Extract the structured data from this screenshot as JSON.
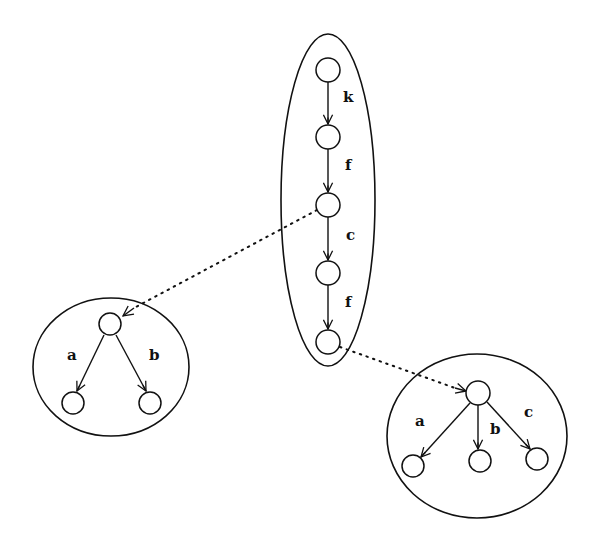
{
  "diagram": {
    "type": "tree-of-clusters",
    "chain": {
      "nodes": [
        {
          "id": "n1",
          "x": 328,
          "y": 70
        },
        {
          "id": "n2",
          "x": 328,
          "y": 137
        },
        {
          "id": "n3",
          "x": 328,
          "y": 205
        },
        {
          "id": "n4",
          "x": 328,
          "y": 273
        },
        {
          "id": "n5",
          "x": 328,
          "y": 342
        }
      ],
      "edges": [
        {
          "from": "n1",
          "to": "n2",
          "label": "k"
        },
        {
          "from": "n2",
          "to": "n3",
          "label": "f"
        },
        {
          "from": "n3",
          "to": "n4",
          "label": "c"
        },
        {
          "from": "n4",
          "to": "n5",
          "label": "f"
        }
      ]
    },
    "left_cluster": {
      "root": {
        "id": "L0",
        "x": 110,
        "y": 324
      },
      "children": [
        {
          "id": "L1",
          "x": 73,
          "y": 403,
          "label": "a"
        },
        {
          "id": "L2",
          "x": 150,
          "y": 403,
          "label": "b"
        }
      ]
    },
    "right_cluster": {
      "root": {
        "id": "R0",
        "x": 478,
        "y": 393
      },
      "children": [
        {
          "id": "R1",
          "x": 413,
          "y": 466,
          "label": "a"
        },
        {
          "id": "R2",
          "x": 480,
          "y": 461,
          "label": "b"
        },
        {
          "id": "R3",
          "x": 537,
          "y": 459,
          "label": "c"
        }
      ]
    },
    "dotted_links": [
      {
        "from": "n3",
        "to": "L0"
      },
      {
        "from": "n5",
        "to": "R0"
      }
    ],
    "labels": {
      "chain_k": "k",
      "chain_f1": "f",
      "chain_c": "c",
      "chain_f2": "f",
      "left_a": "a",
      "left_b": "b",
      "right_a": "a",
      "right_b": "b",
      "right_c": "c"
    }
  }
}
